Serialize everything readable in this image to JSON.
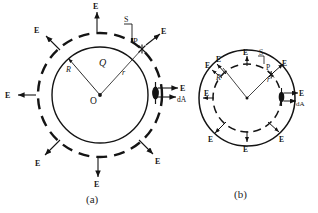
{
  "figure": {
    "background_color": "#ffffff",
    "ink_color": "#141414",
    "panels": [
      {
        "id": "a",
        "caption": "(a)",
        "description": "Gaussian surface outside the charged sphere",
        "center_label": "O",
        "charge_label": "Q",
        "inner_radius_label": "R",
        "outer_radius_label": "r",
        "gaussian_surface_label": "S",
        "point_label": "P",
        "area_element_label": "dA",
        "field_label": "E",
        "solid_circle_role": "charged-sphere",
        "dashed_circle_role": "gaussian-surface",
        "field_arrow_labels": [
          "E",
          "E",
          "E",
          "E",
          "E",
          "E",
          "E"
        ],
        "field_direction": "outward"
      },
      {
        "id": "b",
        "caption": "(b)",
        "description": "Gaussian surface inside the charged sphere",
        "center_label": "",
        "charge_label": "",
        "outer_radius_label": "R",
        "inner_radius_label": "r",
        "gaussian_surface_label": "S",
        "point_label": "P",
        "area_element_label": "dA",
        "field_label": "E",
        "solid_circle_role": "charged-sphere",
        "dashed_circle_role": "gaussian-surface",
        "field_arrow_labels": [
          "E",
          "E",
          "E",
          "E",
          "E",
          "E",
          "E"
        ],
        "field_direction": "outward"
      }
    ]
  }
}
